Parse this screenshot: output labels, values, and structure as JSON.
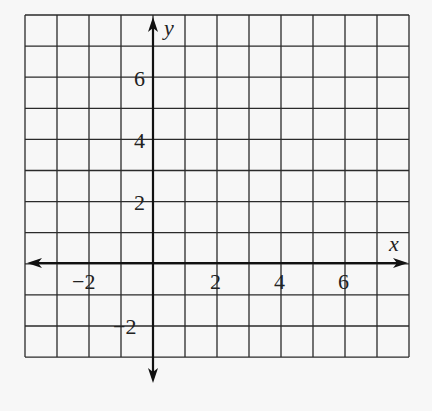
{
  "diagram": {
    "type": "coordinate-grid",
    "x_axis_label": "x",
    "y_axis_label": "y",
    "x_range": [
      -4,
      8
    ],
    "y_range": [
      -3,
      8
    ],
    "grid_spacing": 1,
    "x_tick_labels": [
      {
        "value": -2,
        "text": "−2"
      },
      {
        "value": 2,
        "text": "2"
      },
      {
        "value": 4,
        "text": "4"
      },
      {
        "value": 6,
        "text": "6"
      }
    ],
    "y_tick_labels": [
      {
        "value": 6,
        "text": "6"
      },
      {
        "value": 4,
        "text": "4"
      },
      {
        "value": 2,
        "text": "2"
      },
      {
        "value": -2,
        "text": "−2"
      }
    ],
    "colors": {
      "background": "#f7f7f7",
      "grid": "#2a2a2a",
      "axis": "#111111"
    }
  }
}
